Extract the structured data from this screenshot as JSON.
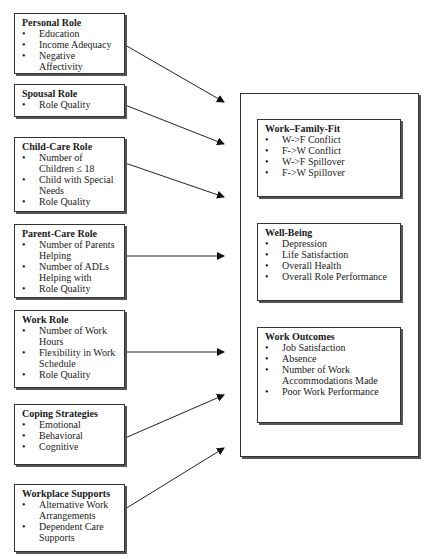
{
  "predictors": [
    {
      "title": "Personal Role",
      "items": [
        "Education",
        "Income Adequacy",
        "Negative Affectivity"
      ]
    },
    {
      "title": "Spousal Role",
      "items": [
        "Role Quality"
      ]
    },
    {
      "title": "Child-Care Role",
      "items": [
        "Number of Children ≤ 18",
        "Child with Special Needs",
        "Role Quality"
      ]
    },
    {
      "title": "Parent-Care Role",
      "items": [
        "Number of Parents Helping",
        "Number of ADLs Helping with",
        "Role Quality"
      ]
    },
    {
      "title": "Work Role",
      "items": [
        "Number of Work Hours",
        "Flexibility in Work Schedule",
        "Role Quality"
      ]
    },
    {
      "title": "Coping Strategies",
      "items": [
        "Emotional",
        "Behavioral",
        "Cognitive"
      ]
    },
    {
      "title": "Workplace Supports",
      "items": [
        "Alternative Work Arrangements",
        "Dependent Care Supports"
      ]
    }
  ],
  "outcomes": [
    {
      "title": "Work–Family-Fit",
      "items": [
        "W->F Conflict",
        "F->W Conflict",
        "W->F  Spillover",
        "F->W Spillover"
      ]
    },
    {
      "title": "Well-Being",
      "items": [
        "Depression",
        "Life Satisfaction",
        "Overall Health",
        "Overall Role Performance"
      ]
    },
    {
      "title": "Work Outcomes",
      "items": [
        "Job Satisfaction",
        "Absence",
        "Number of Work Accommodations Made",
        "Poor Work Performance"
      ]
    }
  ],
  "bullet": "•"
}
